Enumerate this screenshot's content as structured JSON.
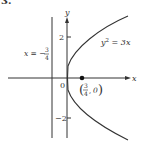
{
  "problem": {
    "number": "3."
  },
  "axes": {
    "x_label": "x",
    "y_label": "y",
    "origin_label": "0",
    "y_ticks": [
      {
        "value": 2,
        "label": "2"
      },
      {
        "value": -2,
        "label": "−2"
      }
    ]
  },
  "curve": {
    "equation_lhs": "y",
    "equation_exp": "2",
    "equation_rhs": " = 3x"
  },
  "directrix": {
    "label_prefix": "x = −",
    "frac_num": "3",
    "frac_den": "4"
  },
  "focus": {
    "frac_num": "3",
    "frac_den": "4",
    "y": "0"
  },
  "colors": {
    "ink": "#333333",
    "background": "#ffffff"
  }
}
